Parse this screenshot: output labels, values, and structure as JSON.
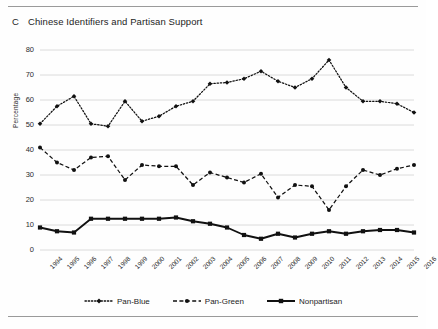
{
  "panel": {
    "letter": "C",
    "title": "Chinese Identifiers and Partisan Support"
  },
  "chart_data": {
    "type": "line",
    "title": "Chinese Identifiers and Partisan Support",
    "xlabel": "",
    "ylabel": "Percentage",
    "ylim": [
      0,
      80
    ],
    "yticks": [
      0,
      10,
      20,
      30,
      40,
      50,
      60,
      70,
      80
    ],
    "grid": true,
    "legend_position": "bottom",
    "categories": [
      "1994",
      "1995",
      "1996",
      "1997",
      "1998",
      "1999",
      "2000",
      "2001",
      "2002",
      "2003",
      "2004",
      "2005",
      "2006",
      "2007",
      "2008",
      "2009",
      "2010",
      "2011",
      "2012",
      "2013",
      "2014",
      "2015",
      "2016"
    ],
    "series": [
      {
        "name": "Pan-Blue",
        "style": "dotted",
        "marker": "diamond",
        "color": "#111111",
        "values": [
          50.5,
          57.5,
          61.5,
          50.5,
          49.5,
          59.5,
          51.5,
          53.5,
          57.5,
          59.5,
          66.5,
          67.0,
          68.5,
          71.5,
          67.5,
          65.0,
          68.5,
          76.0,
          65.0,
          59.5,
          59.5,
          58.5,
          55.0
        ]
      },
      {
        "name": "Pan-Green",
        "style": "dashed",
        "marker": "circle",
        "color": "#111111",
        "values": [
          41.0,
          35.0,
          32.0,
          37.0,
          37.5,
          28.0,
          34.0,
          33.5,
          33.5,
          26.0,
          31.0,
          29.0,
          27.0,
          30.5,
          21.0,
          26.0,
          25.5,
          16.0,
          25.5,
          32.0,
          30.0,
          32.5,
          34.0
        ]
      },
      {
        "name": "Nonpartisan",
        "style": "solid",
        "marker": "square",
        "color": "#111111",
        "values": [
          9.0,
          7.5,
          7.0,
          12.5,
          12.5,
          12.5,
          12.5,
          12.5,
          13.0,
          11.5,
          10.5,
          9.0,
          6.0,
          4.5,
          6.5,
          5.0,
          6.5,
          7.5,
          6.5,
          7.5,
          8.0,
          8.0,
          7.0
        ]
      }
    ]
  },
  "legend": {
    "items": [
      {
        "label": "Pan-Blue"
      },
      {
        "label": "Pan-Green"
      },
      {
        "label": "Nonpartisan"
      }
    ]
  }
}
